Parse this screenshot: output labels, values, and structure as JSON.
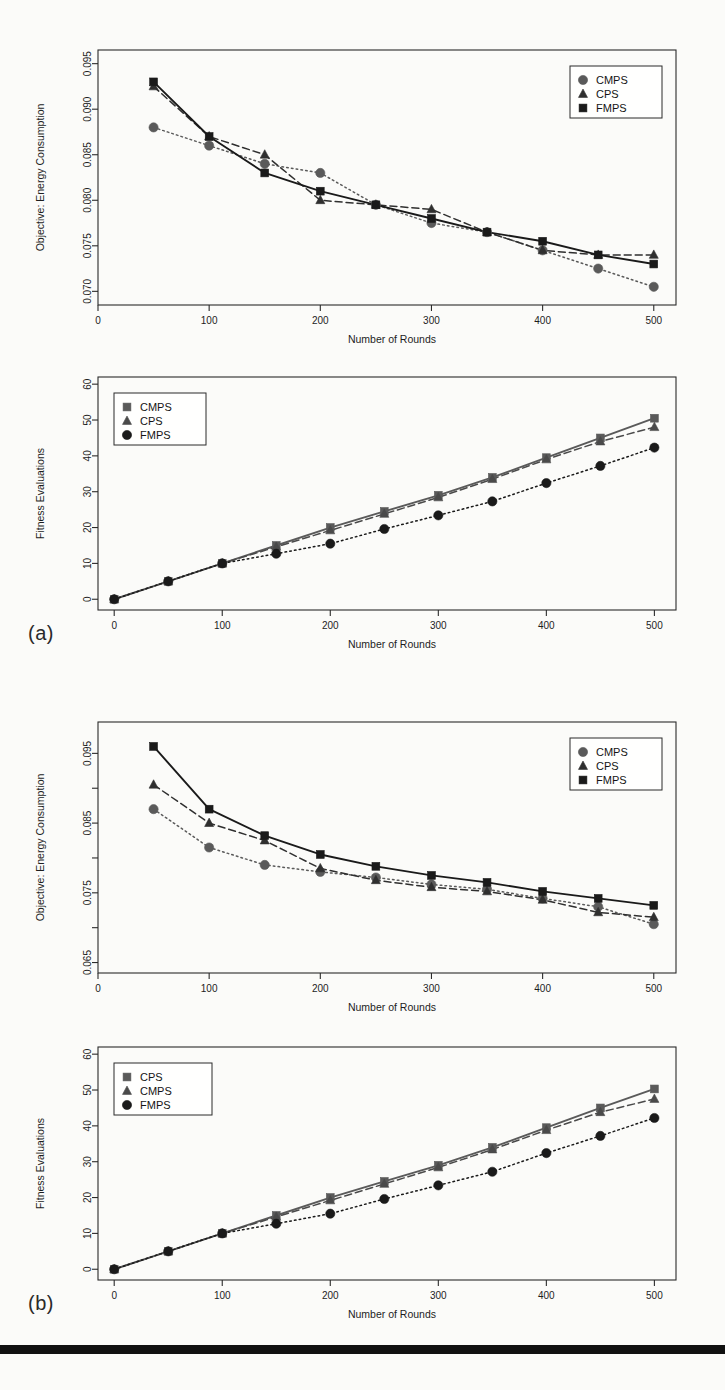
{
  "page": {
    "background": "#fbfbf9",
    "bottom_bar_color": "#111111",
    "panels": [
      {
        "label": "(a)"
      },
      {
        "label": "(b)"
      }
    ]
  },
  "colors": {
    "cmps_gray": "#5a5a5a",
    "cps_dark": "#2f2f2f",
    "fmps_black": "#1a1a1a",
    "frame": "#2b2b2b",
    "text": "#1d1d1d"
  },
  "chart_data": [
    {
      "id": "a-top",
      "type": "line",
      "title": "",
      "xlabel": "Number of Rounds",
      "ylabel": "Objective: Energy Consumption",
      "x": [
        50,
        100,
        150,
        200,
        250,
        300,
        350,
        400,
        450,
        500
      ],
      "xticks": [
        0,
        100,
        200,
        300,
        400,
        500
      ],
      "yticks": [
        0.07,
        0.075,
        0.08,
        0.085,
        0.09,
        0.095
      ],
      "ytick_labels": [
        "0.070",
        "0.075",
        "0.080",
        "0.085",
        "0.090",
        "0.095"
      ],
      "xlim": [
        0,
        520
      ],
      "ylim": [
        0.0685,
        0.0965
      ],
      "grid": false,
      "legend_position": "top-right",
      "series": [
        {
          "name": "CMPS",
          "marker": "circle",
          "linestyle": "dotted",
          "color": "#5a5a5a",
          "values": [
            0.088,
            0.086,
            0.084,
            0.083,
            0.0795,
            0.0775,
            0.0765,
            0.0745,
            0.0725,
            0.0705
          ]
        },
        {
          "name": "CPS",
          "marker": "triangle",
          "linestyle": "dashed",
          "color": "#2f2f2f",
          "values": [
            0.0925,
            0.087,
            0.085,
            0.08,
            0.0795,
            0.079,
            0.0765,
            0.0745,
            0.074,
            0.074
          ]
        },
        {
          "name": "FMPS",
          "marker": "square",
          "linestyle": "solid",
          "color": "#1a1a1a",
          "values": [
            0.093,
            0.087,
            0.083,
            0.081,
            0.0795,
            0.078,
            0.0765,
            0.0755,
            0.074,
            0.073
          ]
        }
      ]
    },
    {
      "id": "a-bottom",
      "type": "line",
      "title": "",
      "xlabel": "Number of Rounds",
      "ylabel": "Fitness Evaluations",
      "x": [
        0,
        50,
        100,
        150,
        200,
        250,
        300,
        350,
        400,
        450,
        500
      ],
      "xticks": [
        0,
        100,
        200,
        300,
        400,
        500
      ],
      "yticks": [
        0,
        10,
        20,
        30,
        40,
        50,
        60
      ],
      "ytick_labels": [
        "0",
        "10",
        "20",
        "30",
        "40",
        "50",
        "60"
      ],
      "xlim": [
        -15,
        520
      ],
      "ylim": [
        -3,
        62
      ],
      "grid": false,
      "legend_position": "top-left",
      "series": [
        {
          "name": "CMPS",
          "marker": "square",
          "linestyle": "solid",
          "color": "#5a5a5a",
          "values": [
            0,
            5,
            10,
            15,
            20,
            24.5,
            29,
            34,
            39.5,
            45,
            50.5
          ]
        },
        {
          "name": "CPS",
          "marker": "triangle",
          "linestyle": "dashed",
          "color": "#4a4a4a",
          "values": [
            0,
            5,
            10,
            14.6,
            19.2,
            23.8,
            28.4,
            33.5,
            39,
            44,
            48
          ]
        },
        {
          "name": "FMPS",
          "marker": "circle",
          "linestyle": "dotted",
          "color": "#1a1a1a",
          "values": [
            0,
            5,
            10,
            12.7,
            15.5,
            19.6,
            23.4,
            27.3,
            32.4,
            37.2,
            42.3
          ]
        }
      ]
    },
    {
      "id": "b-top",
      "type": "line",
      "title": "",
      "xlabel": "Number of Rounds",
      "ylabel": "Objective: Energy Consumption",
      "x": [
        50,
        100,
        150,
        200,
        250,
        300,
        350,
        400,
        450,
        500
      ],
      "xticks": [
        0,
        100,
        200,
        300,
        400,
        500
      ],
      "yticks": [
        0.065,
        0.075,
        0.085,
        0.095
      ],
      "ytick_labels": [
        "0.065",
        "0.075",
        "0.085",
        "0.095"
      ],
      "ytick_minor": [
        0.07,
        0.08,
        0.09,
        0.1
      ],
      "xlim": [
        0,
        520
      ],
      "ylim": [
        0.0635,
        0.0995
      ],
      "grid": false,
      "legend_position": "top-right",
      "series": [
        {
          "name": "CMPS",
          "marker": "circle",
          "linestyle": "dotted",
          "color": "#5a5a5a",
          "values": [
            0.087,
            0.0815,
            0.079,
            0.078,
            0.0772,
            0.0762,
            0.0755,
            0.0742,
            0.073,
            0.0705
          ]
        },
        {
          "name": "CPS",
          "marker": "triangle",
          "linestyle": "dashed",
          "color": "#2f2f2f",
          "values": [
            0.0905,
            0.085,
            0.0825,
            0.0785,
            0.0768,
            0.0758,
            0.0752,
            0.074,
            0.0722,
            0.0715
          ]
        },
        {
          "name": "FMPS",
          "marker": "square",
          "linestyle": "solid",
          "color": "#1a1a1a",
          "values": [
            0.096,
            0.087,
            0.0832,
            0.0805,
            0.0788,
            0.0775,
            0.0765,
            0.0752,
            0.0742,
            0.0732
          ]
        }
      ]
    },
    {
      "id": "b-bottom",
      "type": "line",
      "title": "",
      "xlabel": "Number of Rounds",
      "ylabel": "Fitness Evaluations",
      "x": [
        0,
        50,
        100,
        150,
        200,
        250,
        300,
        350,
        400,
        450,
        500
      ],
      "xticks": [
        0,
        100,
        200,
        300,
        400,
        500
      ],
      "yticks": [
        0,
        10,
        20,
        30,
        40,
        50,
        60
      ],
      "ytick_labels": [
        "0",
        "10",
        "20",
        "30",
        "40",
        "50",
        "60"
      ],
      "xlim": [
        -15,
        520
      ],
      "ylim": [
        -3,
        62
      ],
      "grid": false,
      "legend_position": "top-left",
      "series": [
        {
          "name": "CPS",
          "marker": "square",
          "linestyle": "solid",
          "color": "#5a5a5a",
          "values": [
            0,
            5,
            10,
            15,
            20,
            24.5,
            29,
            34,
            39.5,
            45,
            50.3
          ]
        },
        {
          "name": "CMPS",
          "marker": "triangle",
          "linestyle": "dashed",
          "color": "#4a4a4a",
          "values": [
            0,
            5,
            10,
            14.6,
            19.2,
            23.8,
            28.4,
            33.4,
            38.8,
            43.8,
            47.5
          ]
        },
        {
          "name": "FMPS",
          "marker": "circle",
          "linestyle": "dotted",
          "color": "#1a1a1a",
          "values": [
            0,
            5,
            10,
            12.7,
            15.5,
            19.6,
            23.4,
            27.2,
            32.4,
            37.2,
            42.2
          ]
        }
      ]
    }
  ]
}
